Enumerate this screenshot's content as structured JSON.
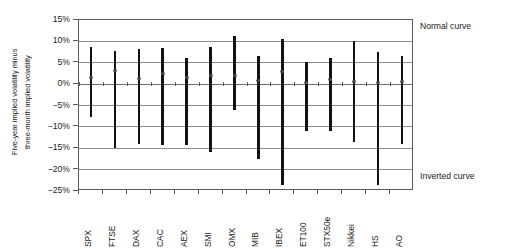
{
  "chart_data": {
    "type": "bar",
    "subtype": "high-low-mean range bars",
    "title": "",
    "xlabel": "",
    "ylabel": "Five-year implied volatility minus three-month implied volatility",
    "ylabel_lines": [
      "Five-year implied volatility minus",
      "three-month implied volatility"
    ],
    "ylim": [
      -25,
      15
    ],
    "ytick_values": [
      15,
      10,
      5,
      0,
      -5,
      -10,
      -15,
      -20,
      -25
    ],
    "ytick_labels": [
      "15%",
      "10%",
      "5%",
      "0%",
      "-5%",
      "-10%",
      "-15%",
      "-20%",
      "-25%"
    ],
    "grid": true,
    "legend": "none",
    "categories": [
      "SPX",
      "FTSE",
      "DAX",
      "CAC",
      "AEX",
      "SMI",
      "OMX",
      "MIB",
      "IBEX",
      "ET100",
      "STX50e",
      "Nikkei",
      "HS",
      "AO"
    ],
    "series": [
      {
        "name": "High",
        "values": [
          8.6,
          7.8,
          8.1,
          8.4,
          6.2,
          8.8,
          11.2,
          6.5,
          10.5,
          5.2,
          6.0,
          10.2,
          7.5,
          6.5
        ]
      },
      {
        "name": "Low",
        "values": [
          -7.8,
          -15.0,
          -14.0,
          -14.2,
          -14.2,
          -15.9,
          -6.1,
          -17.5,
          -23.5,
          -11.0,
          -11.0,
          -13.5,
          -23.5,
          -14.0
        ]
      },
      {
        "name": "Mean",
        "values": [
          1.5,
          3.2,
          1.2,
          2.4,
          1.6,
          2.0,
          2.0,
          0.8,
          3.0,
          0.3,
          1.0,
          0.5,
          0.3,
          0.7
        ]
      }
    ],
    "annotations": [
      {
        "text": "Normal curve",
        "position": "upper-right-outside"
      },
      {
        "text": "Inverted curve",
        "position": "lower-right-outside"
      }
    ],
    "colors": {
      "bar": "#121212",
      "mean_marker": "#4a4a4a",
      "gridline": "#8d8d8d",
      "axis": "#5b5b5b",
      "background": "#ffffff"
    }
  }
}
